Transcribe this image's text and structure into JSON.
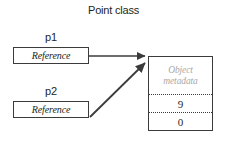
{
  "diagram": {
    "title": "Point class",
    "variables": [
      {
        "name": "p1",
        "box_text": "Reference"
      },
      {
        "name": "p2",
        "box_text": "Reference"
      }
    ],
    "object": {
      "metadata_line_1": "Object",
      "metadata_line_2": "metadata",
      "fields": [
        {
          "value": "9"
        },
        {
          "value": "0"
        }
      ]
    },
    "arrows": [
      {
        "from": "p1",
        "to": "object",
        "style": "straight"
      },
      {
        "from": "p2",
        "to": "object",
        "style": "diagonal"
      }
    ],
    "colors": {
      "stroke": "#3b3b3b",
      "text": "#231f20",
      "metadata_text": "#a8a8a8",
      "background": "#ffffff"
    }
  }
}
